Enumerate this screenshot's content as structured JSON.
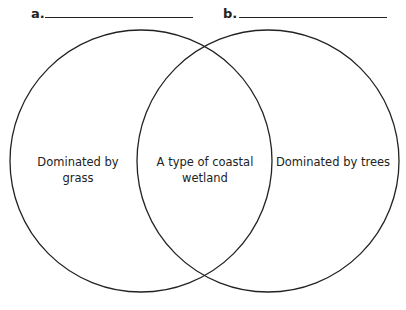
{
  "labels": {
    "a": "a.",
    "b": "b."
  },
  "regions": {
    "left": "Dominated by grass",
    "overlap_line1": "A type of coastal",
    "overlap_line2": "wetland",
    "right": "Dominated by trees"
  },
  "colors": {
    "stroke": "#222222",
    "background": "#ffffff"
  }
}
